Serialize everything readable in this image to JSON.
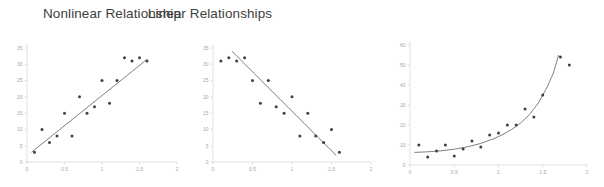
{
  "figure": {
    "background_color": "#ffffff",
    "point_color": "#404040",
    "line_color": "#808080",
    "axis_color": "#d9d9d9",
    "tick_label_color": "#a6a6a6",
    "title_color": "#404040"
  },
  "titles": {
    "linear": "Linear Relationships",
    "nonlinear": "Nonlinear Relationship"
  },
  "chart_data": [
    {
      "type": "scatter",
      "name": "positive-linear",
      "title": "Linear Relationships",
      "subtitle": "",
      "xlabel": "",
      "ylabel": "",
      "xlim": [
        0,
        2
      ],
      "ylim": [
        0,
        35
      ],
      "xticks": [
        0,
        0.5,
        1,
        1.5,
        2
      ],
      "xtick_labels": [
        "0",
        "0.5",
        "1",
        "1.5",
        "2"
      ],
      "yticks": [
        0,
        5,
        10,
        15,
        20,
        25,
        30,
        35
      ],
      "ytick_labels": [
        "0",
        "5",
        "10",
        "15",
        "20",
        "25",
        "30",
        "35"
      ],
      "grid": false,
      "legend": false,
      "x": [
        0.1,
        0.2,
        0.3,
        0.4,
        0.5,
        0.6,
        0.7,
        0.8,
        0.9,
        1.0,
        1.1,
        1.2,
        1.3,
        1.4,
        1.5,
        1.6
      ],
      "y": [
        3,
        10,
        6,
        8,
        15,
        8,
        20,
        15,
        17,
        25,
        18,
        25,
        32,
        31,
        32,
        31
      ],
      "trendline": {
        "type": "linear",
        "x0": 0.06,
        "y0": 3,
        "x1": 1.6,
        "y1": 31.5
      }
    },
    {
      "type": "scatter",
      "name": "negative-linear",
      "title": "Linear Relationships",
      "subtitle": "",
      "xlabel": "",
      "ylabel": "",
      "xlim": [
        0,
        2
      ],
      "ylim": [
        0,
        35
      ],
      "xticks": [
        0,
        0.5,
        1,
        1.5,
        2
      ],
      "xtick_labels": [
        "0",
        "0.5",
        "1",
        "1.5",
        "2"
      ],
      "yticks": [
        0,
        5,
        10,
        15,
        20,
        25,
        30,
        35
      ],
      "ytick_labels": [
        "0",
        "5",
        "10",
        "15",
        "20",
        "25",
        "30",
        "35"
      ],
      "grid": false,
      "legend": false,
      "x": [
        0.1,
        0.2,
        0.3,
        0.4,
        0.5,
        0.6,
        0.7,
        0.8,
        0.9,
        1.0,
        1.1,
        1.2,
        1.3,
        1.4,
        1.5,
        1.6
      ],
      "y": [
        31,
        32,
        31,
        32,
        25,
        18,
        25,
        17,
        15,
        20,
        8,
        15,
        8,
        6,
        10,
        3
      ],
      "trendline": {
        "type": "linear",
        "x0": 0.24,
        "y0": 34,
        "x1": 1.56,
        "y1": 2
      }
    },
    {
      "type": "scatter",
      "name": "nonlinear-exponential",
      "title": "Nonlinear Relationship",
      "subtitle": "",
      "xlabel": "",
      "ylabel": "",
      "xlim": [
        0,
        2
      ],
      "ylim": [
        0,
        60
      ],
      "xticks": [
        0,
        0.5,
        1,
        1.5,
        2
      ],
      "xtick_labels": [
        "0",
        "0.5",
        "1",
        "1.5",
        "2"
      ],
      "yticks": [
        0,
        10,
        20,
        30,
        40,
        50,
        60
      ],
      "ytick_labels": [
        "0",
        "10",
        "20",
        "30",
        "40",
        "50",
        "60"
      ],
      "grid": false,
      "legend": false,
      "x": [
        0.1,
        0.2,
        0.3,
        0.4,
        0.5,
        0.6,
        0.7,
        0.8,
        0.9,
        1.0,
        1.1,
        1.2,
        1.3,
        1.4,
        1.5,
        1.7,
        1.8
      ],
      "y": [
        10,
        4,
        7,
        10,
        4.5,
        8,
        12,
        9,
        15,
        16,
        20,
        20,
        28,
        24,
        35,
        54,
        50
      ],
      "trendline": {
        "type": "exponential",
        "points": [
          [
            0.05,
            6.3
          ],
          [
            0.2,
            6.6
          ],
          [
            0.35,
            7.1
          ],
          [
            0.5,
            7.9
          ],
          [
            0.65,
            9.1
          ],
          [
            0.8,
            10.8
          ],
          [
            0.95,
            13.2
          ],
          [
            1.05,
            15.3
          ],
          [
            1.15,
            17.8
          ],
          [
            1.25,
            21.0
          ],
          [
            1.35,
            25.2
          ],
          [
            1.45,
            31.0
          ],
          [
            1.55,
            39.0
          ],
          [
            1.62,
            46.0
          ],
          [
            1.68,
            55.0
          ]
        ]
      }
    }
  ]
}
